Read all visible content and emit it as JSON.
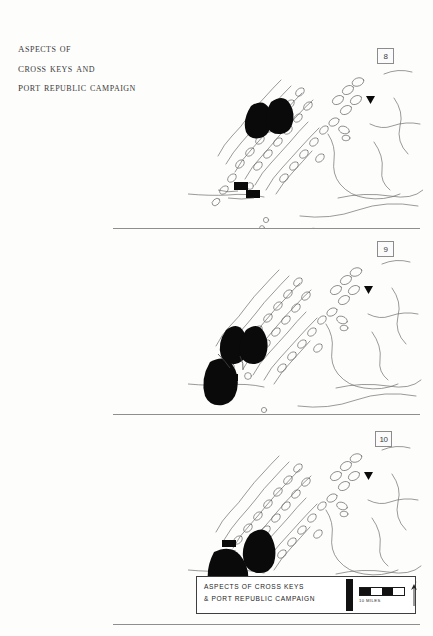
{
  "page": {
    "background_color": "#fdfdfc",
    "ink_color": "#2b2b2b"
  },
  "title_block": {
    "lines": [
      "Aspects of",
      "Cross Keys and",
      "Port Republic Campaign"
    ]
  },
  "panels": [
    {
      "number": "8",
      "name": "map-panel-8",
      "caption": "Shenandoah Valley map, troop positions north of Port Republic"
    },
    {
      "number": "9",
      "name": "map-panel-9",
      "caption": "Shenandoah Valley map, converging troop positions near Cross Keys"
    },
    {
      "number": "10",
      "name": "map-panel-10",
      "caption": "Shenandoah Valley map, final troop concentration at Port Republic"
    }
  ],
  "legend": {
    "title_line_1": "ASPECTS OF CROSS KEYS",
    "title_line_2": "& PORT REPUBLIC CAMPAIGN",
    "scale_label": "10 MILES",
    "north_letter": "N",
    "bar_color": "#111111"
  }
}
